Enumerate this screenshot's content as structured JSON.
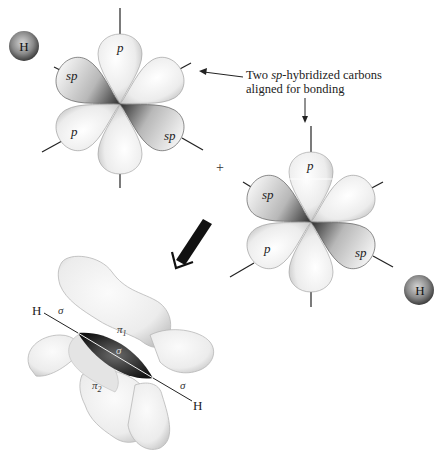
{
  "figure": {
    "colors": {
      "background": "#ffffff",
      "lobe_light": "#f2f2f2",
      "lobe_mid": "#c8c8c8",
      "lobe_dark": "#3a3a3a",
      "line": "#222222",
      "arrow": "#111111"
    }
  },
  "annotation": {
    "caption_line1_prefix": "Two ",
    "caption_line1_ital": "sp",
    "caption_line1_suffix": "-hybridized carbons",
    "caption_line2": "aligned for bonding"
  },
  "plus_sign": "+",
  "carbon_top": {
    "center": [
      120,
      104
    ],
    "labels": {
      "p_up": "p",
      "sp_left": "sp",
      "p_lower_left": "p",
      "sp_lower_right": "sp"
    },
    "hydrogen": {
      "label": "H",
      "center": [
        24,
        46
      ]
    }
  },
  "carbon_bottom": {
    "center": [
      311,
      222
    ],
    "labels": {
      "p_up": "p",
      "sp_left": "sp",
      "p_lower_left": "p",
      "sp_lower_right": "sp"
    },
    "hydrogen": {
      "label": "H",
      "center": [
        419,
        290
      ]
    }
  },
  "product": {
    "labels": {
      "h_left": "H",
      "h_right": "H",
      "sigma_left": "σ",
      "sigma_center": "σ",
      "sigma_right": "σ",
      "pi1": "π",
      "pi1_sub": "1",
      "pi2": "π",
      "pi2_sub": "2"
    }
  }
}
